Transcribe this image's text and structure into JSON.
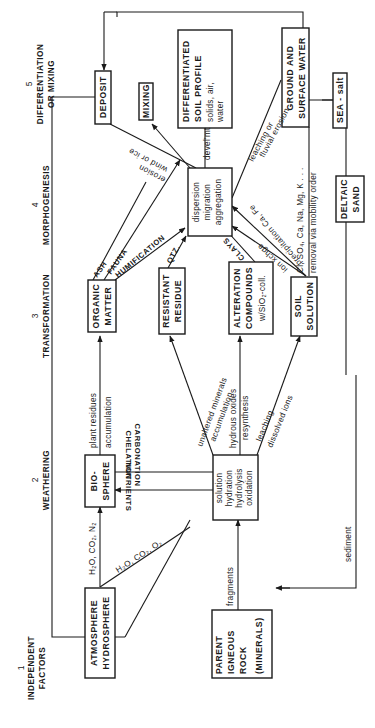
{
  "columns": [
    {
      "number": "1",
      "line1": "INDEPENDENT",
      "line2": "FACTORS"
    },
    {
      "number": "2",
      "line1": "WEATHERING",
      "line2": ""
    },
    {
      "number": "3",
      "line1": "TRANSFORMATION",
      "line2": ""
    },
    {
      "number": "4",
      "line1": "MORPHOGENESIS",
      "line2": ""
    },
    {
      "number": "5",
      "line1": "DIFFERENTIATION",
      "line2": "OR MIXING"
    }
  ],
  "boxes": {
    "atmosphere": {
      "line1": "ATMOSPHERE",
      "line2": "HYDROSPHERE"
    },
    "parent_rock": {
      "line1": "PARENT",
      "line2": "IGNEOUS",
      "line3": "ROCK",
      "line4": "(MINERALS)"
    },
    "biosphere": {
      "line1": "BIO-",
      "line2": "SPHERE"
    },
    "weathering": {
      "line1": "solution",
      "line2": "hydration",
      "line3": "hydrolysis",
      "line4": "oxidation"
    },
    "organic_matter": {
      "line1": "ORGANIC",
      "line2": "MATTER"
    },
    "resistant_residue": {
      "line1": "RESISTANT",
      "line2": "RESIDUE"
    },
    "alteration": {
      "line1": "ALTERATION",
      "line2": "COMPOUNDS",
      "line3": "w/SiO₂-coll."
    },
    "soil_solution": {
      "line1": "SOIL",
      "line2": "SOLUTION"
    },
    "morphogenesis": {
      "line1": "dispersion",
      "line2": "migration",
      "line3": "aggregation"
    },
    "deposit": {
      "line1": "DEPOSIT"
    },
    "mixing": {
      "line1": "MIXING"
    },
    "soil_profile": {
      "line1": "DIFFERENTIATED",
      "line2": "SOIL PROFILE",
      "line3": "solids, air,",
      "line4": "water"
    },
    "ground_water": {
      "line1": "GROUND AND",
      "line2": "SURFACE WATER"
    },
    "sea_salt": {
      "line1": "SEA - salt"
    },
    "deltaic_sand": {
      "line1": "DELTAIC",
      "line2": "SAND"
    }
  },
  "labels": {
    "h2o_co2_n2": "H₂O, CO₂, N₂",
    "h2o_co2_o2": "H₂O, CO₂, O₂",
    "fragments": "fragments",
    "sediment": "sediment",
    "chelation": "CHELATION",
    "carbonation": "CARBONATION",
    "nutrients": "NUTRIENTS",
    "plant_residues": "plant residues",
    "accumulation": "accumulation",
    "unaltered_minerals": "unaltered minerals",
    "accumulation2": "accumulation",
    "hydrous_oxides": "hydrous oxides",
    "resynthesis": "resynthesis",
    "leaching": "leaching",
    "dissolved_ions": "dissolved ions",
    "ash": "ASH",
    "fauna": "FAUNA",
    "humification": "HUMIFICATION",
    "qtz": "QTZ.",
    "clays": "CLAYS",
    "ion_xchge": "ion xchge",
    "precipitation": "precipitation Ca, Fe",
    "cl_so4": "Cl, SO₄, Ca, Na, Mg, K . . .",
    "removal": "removal via mobility order",
    "leaching_or": "leaching or",
    "fluvial_erosion": "fluvial erosion",
    "develmt": "devel'mt",
    "erosion": "erosion",
    "wind_or_ice": "wind or ice"
  }
}
